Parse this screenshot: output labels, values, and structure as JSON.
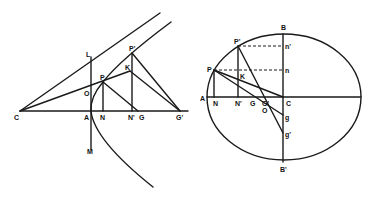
{
  "figure_left": {
    "title": "parabola-construction",
    "labels": {
      "C": "C",
      "A": "A",
      "N": "N",
      "N2": "N'",
      "G": "G",
      "G2": "G'",
      "L": "L",
      "P": "P",
      "P2": "P'",
      "K": "K",
      "O": "O",
      "M": "M"
    }
  },
  "figure_right": {
    "title": "ellipse-construction",
    "labels": {
      "B": "B",
      "B2": "B'",
      "P": "P",
      "P2": "P'",
      "n": "n",
      "n2": "n'",
      "K": "K",
      "A": "A",
      "N": "N",
      "N2": "N'",
      "G": "G",
      "G2": "G'",
      "C": "C",
      "O": "O",
      "g": "g",
      "g2": "g'"
    }
  },
  "colors": {
    "ink": "#1a1a1a",
    "background": "#ffffff"
  }
}
